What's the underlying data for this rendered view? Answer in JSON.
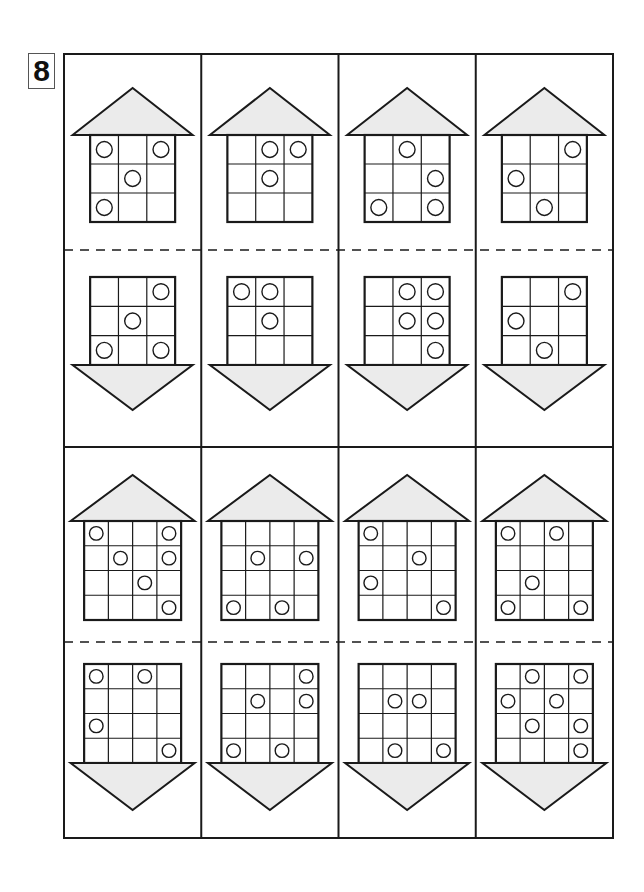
{
  "page_number": "8",
  "colors": {
    "line": "#1a1a1a",
    "roof_fill": "#ebebeb",
    "background": "#ffffff"
  },
  "layout": {
    "frame": {
      "x": 64,
      "y": 54,
      "width": 549,
      "height": 784
    },
    "middle_y": 447,
    "columns": 4
  },
  "rows": [
    {
      "grid_size": 3,
      "cards": [
        {
          "house": [
            [
              1,
              0,
              1
            ],
            [
              0,
              1,
              0
            ],
            [
              1,
              0,
              0
            ]
          ],
          "arrow": [
            [
              0,
              0,
              1
            ],
            [
              0,
              1,
              0
            ],
            [
              1,
              0,
              1
            ]
          ]
        },
        {
          "house": [
            [
              0,
              1,
              1
            ],
            [
              0,
              1,
              0
            ],
            [
              0,
              0,
              0
            ]
          ],
          "arrow": [
            [
              1,
              1,
              0
            ],
            [
              0,
              1,
              0
            ],
            [
              0,
              0,
              0
            ]
          ]
        },
        {
          "house": [
            [
              0,
              1,
              0
            ],
            [
              0,
              0,
              1
            ],
            [
              1,
              0,
              1
            ]
          ],
          "arrow": [
            [
              0,
              1,
              1
            ],
            [
              0,
              1,
              1
            ],
            [
              0,
              0,
              1
            ]
          ]
        },
        {
          "house": [
            [
              0,
              0,
              1
            ],
            [
              1,
              0,
              0
            ],
            [
              0,
              1,
              0
            ]
          ],
          "arrow": [
            [
              0,
              0,
              1
            ],
            [
              1,
              0,
              0
            ],
            [
              0,
              1,
              0
            ]
          ]
        }
      ]
    },
    {
      "grid_size": 4,
      "cards": [
        {
          "house": [
            [
              1,
              0,
              0,
              1
            ],
            [
              0,
              1,
              0,
              1
            ],
            [
              0,
              0,
              1,
              0
            ],
            [
              0,
              0,
              0,
              1
            ]
          ],
          "arrow": [
            [
              1,
              0,
              1,
              0
            ],
            [
              0,
              0,
              0,
              0
            ],
            [
              1,
              0,
              0,
              0
            ],
            [
              0,
              0,
              0,
              1
            ]
          ]
        },
        {
          "house": [
            [
              0,
              0,
              0,
              0
            ],
            [
              0,
              1,
              0,
              1
            ],
            [
              0,
              0,
              0,
              0
            ],
            [
              1,
              0,
              1,
              0
            ]
          ],
          "arrow": [
            [
              0,
              0,
              0,
              1
            ],
            [
              0,
              1,
              0,
              1
            ],
            [
              0,
              0,
              0,
              0
            ],
            [
              1,
              0,
              1,
              0
            ]
          ]
        },
        {
          "house": [
            [
              1,
              0,
              0,
              0
            ],
            [
              0,
              0,
              1,
              0
            ],
            [
              1,
              0,
              0,
              0
            ],
            [
              0,
              0,
              0,
              1
            ]
          ],
          "arrow": [
            [
              0,
              0,
              0,
              0
            ],
            [
              0,
              1,
              1,
              0
            ],
            [
              0,
              0,
              0,
              0
            ],
            [
              0,
              1,
              0,
              1
            ]
          ]
        },
        {
          "house": [
            [
              1,
              0,
              1,
              0
            ],
            [
              0,
              0,
              0,
              0
            ],
            [
              0,
              1,
              0,
              0
            ],
            [
              1,
              0,
              0,
              1
            ]
          ],
          "arrow": [
            [
              0,
              1,
              0,
              1
            ],
            [
              1,
              0,
              1,
              0
            ],
            [
              0,
              1,
              0,
              1
            ],
            [
              0,
              0,
              0,
              1
            ]
          ]
        }
      ]
    }
  ]
}
